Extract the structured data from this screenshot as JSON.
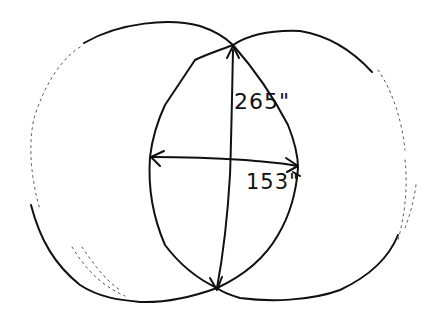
{
  "diagram": {
    "type": "overlapping-circles-lens-sketch",
    "style": "hand-drawn",
    "stroke_color": "#111111",
    "background": "#ffffff",
    "dimensions": {
      "height_label": "265\"",
      "width_label": "153\""
    },
    "shapes": [
      {
        "name": "left-circle"
      },
      {
        "name": "right-circle"
      },
      {
        "name": "lens-overlap"
      },
      {
        "name": "vertical-arrow",
        "label_ref": "height_label"
      },
      {
        "name": "horizontal-arrow",
        "label_ref": "width_label"
      }
    ]
  }
}
